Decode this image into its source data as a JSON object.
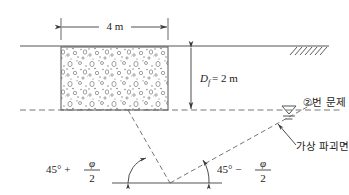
{
  "figure": {
    "labels": {
      "width_dim": "4 m",
      "depth_dim_var": "D",
      "depth_dim_sub": "f",
      "depth_dim_eq": "= 2 m",
      "angle_left_base": "45° +",
      "angle_right_base": "45° −",
      "phi_symbol": "φ",
      "denominator": "2",
      "water_note": "②번 문제",
      "failure_surface_note": "가상 파괴면"
    },
    "colors": {
      "line": "#555555",
      "dash": "#666666",
      "fill_stipple": "#777777",
      "text": "#1a1a1a",
      "background": "#ffffff"
    },
    "icons": {
      "water_table": "water-table-symbol",
      "ground_hatch": "ground-hatching",
      "arrow": "dimension-arrow"
    }
  },
  "geometry": {
    "ground_line_y": 46,
    "water_line_y": 110,
    "footing_left_x": 61,
    "footing_right_x": 168,
    "footing_top_y": 47,
    "footing_bottom_y": 110,
    "wedge_apex_x": 170,
    "wedge_apex_y": 183,
    "baseline_y": 183
  }
}
